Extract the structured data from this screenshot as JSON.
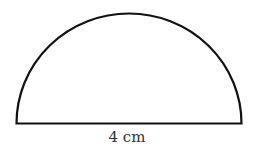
{
  "diagram": {
    "shape": "semicircle",
    "diameter_label": "4 cm",
    "stroke_color": "#111111",
    "fill_color": "#ffffff"
  }
}
